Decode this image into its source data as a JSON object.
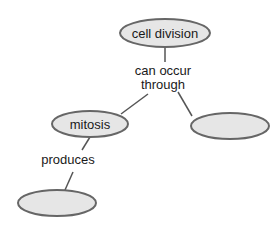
{
  "diagram": {
    "type": "concept-map",
    "colors": {
      "node_fill": "#e6e6e6",
      "node_stroke": "#666666",
      "line": "#555555",
      "text": "#1a1a1a",
      "background": "#ffffff"
    },
    "nodes": [
      {
        "id": "cell-division",
        "label": "cell division"
      },
      {
        "id": "mitosis",
        "label": "mitosis"
      },
      {
        "id": "blank-right",
        "label": ""
      },
      {
        "id": "blank-bottom",
        "label": ""
      }
    ],
    "links": [
      {
        "from": "cell-division",
        "to": [
          "mitosis",
          "blank-right"
        ],
        "label_line1": "can occur",
        "label_line2": "through"
      },
      {
        "from": "mitosis",
        "to": [
          "blank-bottom"
        ],
        "label_line1": "produces"
      }
    ]
  }
}
